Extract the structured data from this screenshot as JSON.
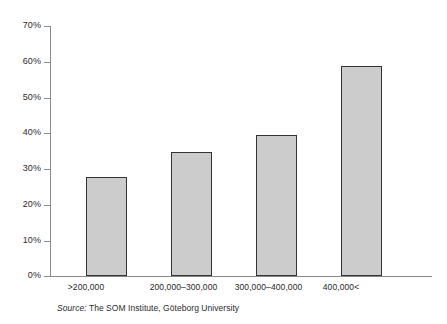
{
  "chart_data": {
    "type": "bar",
    "title": "",
    "subtitle": "",
    "xlabel": "",
    "ylabel": "",
    "categories": [
      ">200,000",
      "200,000–300,000",
      "300,000–400,000",
      "400,000<"
    ],
    "values": [
      27.7,
      34.7,
      39.5,
      58.8
    ],
    "ylim": [
      0,
      70
    ],
    "ytick_step": 10,
    "ytick_labels": [
      "0%",
      "10%",
      "20%",
      "30%",
      "40%",
      "50%",
      "60%",
      "70%"
    ],
    "ytick_values": [
      0,
      10,
      20,
      30,
      40,
      50,
      60,
      70
    ],
    "grid": false,
    "legend": null,
    "bar_fill_color": "#cccccc",
    "bar_border_color": "#333333",
    "axis_color": "#8a8a8a",
    "background_color": "#ffffff"
  },
  "source": {
    "label": "Source:",
    "text": " The SOM Institute, Göteborg University"
  }
}
